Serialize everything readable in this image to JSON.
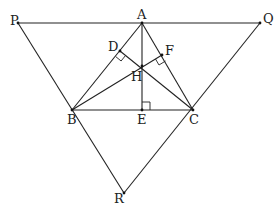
{
  "diagram": {
    "type": "geometry",
    "points": {
      "P": {
        "label": "P",
        "x": 18,
        "y": 23
      },
      "A": {
        "label": "A",
        "x": 142,
        "y": 23
      },
      "Q": {
        "label": "Q",
        "x": 260,
        "y": 23
      },
      "D": {
        "label": "D",
        "x": 120,
        "y": 51
      },
      "F": {
        "label": "F",
        "x": 162,
        "y": 55
      },
      "H": {
        "label": "H",
        "x": 142,
        "y": 66
      },
      "B": {
        "label": "B",
        "x": 72,
        "y": 110
      },
      "E": {
        "label": "E",
        "x": 142,
        "y": 110
      },
      "C": {
        "label": "C",
        "x": 193,
        "y": 110
      },
      "R": {
        "label": "R",
        "x": 124,
        "y": 193
      }
    },
    "segments": [
      [
        "P",
        "Q"
      ],
      [
        "P",
        "R"
      ],
      [
        "Q",
        "R"
      ],
      [
        "A",
        "B"
      ],
      [
        "A",
        "C"
      ],
      [
        "B",
        "C"
      ],
      [
        "A",
        "E"
      ],
      [
        "B",
        "F"
      ],
      [
        "C",
        "D"
      ]
    ],
    "right_angles": [
      "D",
      "F",
      "E"
    ]
  }
}
